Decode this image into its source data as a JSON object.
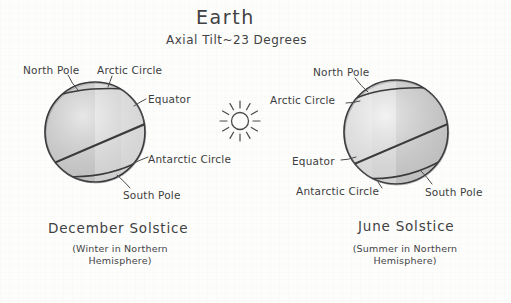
{
  "page": {
    "background_color": "#fdfdfc",
    "ink_color": "#3b3b3d"
  },
  "header": {
    "title": "Earth",
    "subtitle": "Axial Tilt~23 Degrees"
  },
  "sun": {
    "icon": "sun-icon",
    "center_x": 240,
    "center_y": 121,
    "radius": 8,
    "ray_count": 12
  },
  "globes": [
    {
      "id": "december-solstice",
      "center_x": 95,
      "center_y": 132,
      "radius": 50,
      "lit_side": "right",
      "dark_fill": "#c9c9c9",
      "light_fill": "#ebebeb",
      "labels": {
        "north_pole": "North Pole",
        "arctic_circle": "Arctic Circle",
        "equator": "Equator",
        "antarctic_circle": "Antarctic Circle",
        "south_pole": "South Pole"
      },
      "caption": {
        "main": "December Solstice",
        "sub": "(Winter in Northern Hemisphere)"
      }
    },
    {
      "id": "june-solstice",
      "center_x": 396,
      "center_y": 132,
      "radius": 52,
      "lit_side": "left",
      "dark_fill": "#c9c9c9",
      "light_fill": "#ebebeb",
      "labels": {
        "north_pole": "North Pole",
        "arctic_circle": "Arctic Circle",
        "equator": "Equator",
        "antarctic_circle": "Antarctic Circle",
        "south_pole": "South Pole"
      },
      "caption": {
        "main": "June Solstice",
        "sub": "(Summer in Northern Hemisphere)"
      }
    }
  ]
}
